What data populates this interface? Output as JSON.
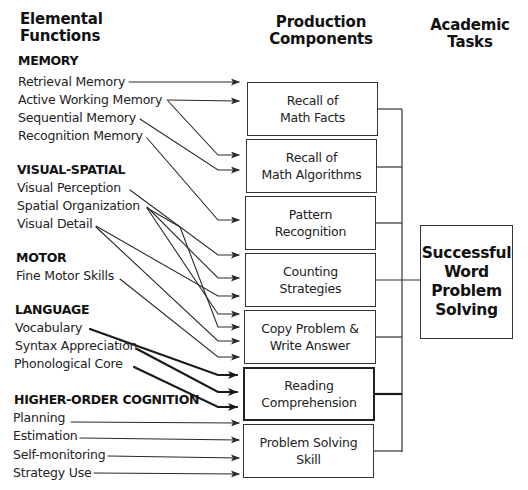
{
  "headers": {
    "elemental": [
      "Elemental",
      "Functions"
    ],
    "production": [
      "Production",
      "Components"
    ],
    "academic": [
      "Academic",
      "Tasks"
    ]
  },
  "sections": [
    {
      "title": "MEMORY",
      "items": [
        "Retrieval Memory",
        "Active Working Memory",
        "Sequential Memory",
        "Recognition Memory"
      ]
    },
    {
      "title": "VISUAL-SPATIAL",
      "items": [
        "Visual Perception",
        "Spatial Organization",
        "Visual Detail"
      ]
    },
    {
      "title": "MOTOR",
      "items": [
        "Fine Motor Skills"
      ]
    },
    {
      "title": "LANGUAGE",
      "items": [
        "Vocabulary",
        "Syntax Appreciation",
        "Phonological Core"
      ]
    },
    {
      "title": "HIGHER-ORDER COGNITION",
      "items": [
        "Planning",
        "Estimation",
        "Self-monitoring",
        "Strategy Use"
      ]
    }
  ],
  "production_components": [
    {
      "line1": "Recall of",
      "line2": "Math Facts",
      "emphasis": false
    },
    {
      "line1": "Recall of",
      "line2": "Math Algorithms",
      "emphasis": false
    },
    {
      "line1": "Pattern",
      "line2": "Recognition",
      "emphasis": false
    },
    {
      "line1": "Counting",
      "line2": "Strategies",
      "emphasis": false
    },
    {
      "line1": "Copy Problem &",
      "line2": "Write Answer",
      "emphasis": false
    },
    {
      "line1": "Reading",
      "line2": "Comprehension",
      "emphasis": true
    },
    {
      "line1": "Problem Solving",
      "line2": "Skill",
      "emphasis": false
    }
  ],
  "academic_task": {
    "lines": [
      "Successful",
      "Word",
      "Problem",
      "Solving"
    ]
  },
  "connections": [
    {
      "from": "Retrieval Memory",
      "to": "Recall of Math Facts"
    },
    {
      "from": "Active Working Memory",
      "to": "Recall of Math Facts"
    },
    {
      "from": "Active Working Memory",
      "to": "Recall of Math Algorithms"
    },
    {
      "from": "Sequential Memory",
      "to": "Recall of Math Algorithms"
    },
    {
      "from": "Recognition Memory",
      "to": "Pattern Recognition"
    },
    {
      "from": "Visual Perception",
      "to": "Counting Strategies"
    },
    {
      "from": "Spatial Organization",
      "to": "Counting Strategies"
    },
    {
      "from": "Spatial Organization",
      "to": "Copy Problem & Write Answer"
    },
    {
      "from": "Spatial Organization",
      "to": "Copy Problem & Write Answer"
    },
    {
      "from": "Visual Detail",
      "to": "Counting Strategies"
    },
    {
      "from": "Visual Detail",
      "to": "Copy Problem & Write Answer"
    },
    {
      "from": "Fine Motor Skills",
      "to": "Copy Problem & Write Answer"
    },
    {
      "from": "Vocabulary",
      "to": "Reading Comprehension"
    },
    {
      "from": "Syntax Appreciation",
      "to": "Reading Comprehension"
    },
    {
      "from": "Phonological Core",
      "to": "Reading Comprehension"
    },
    {
      "from": "Planning",
      "to": "Problem Solving Skill"
    },
    {
      "from": "Estimation",
      "to": "Problem Solving Skill"
    },
    {
      "from": "Self-monitoring",
      "to": "Problem Solving Skill"
    },
    {
      "from": "Strategy Use",
      "to": "Problem Solving Skill"
    },
    {
      "from": "All Production Components",
      "to": "Successful Word Problem Solving"
    }
  ],
  "colors": {
    "line": "#2a2a2a",
    "text": "#222222",
    "background": "#ffffff"
  }
}
